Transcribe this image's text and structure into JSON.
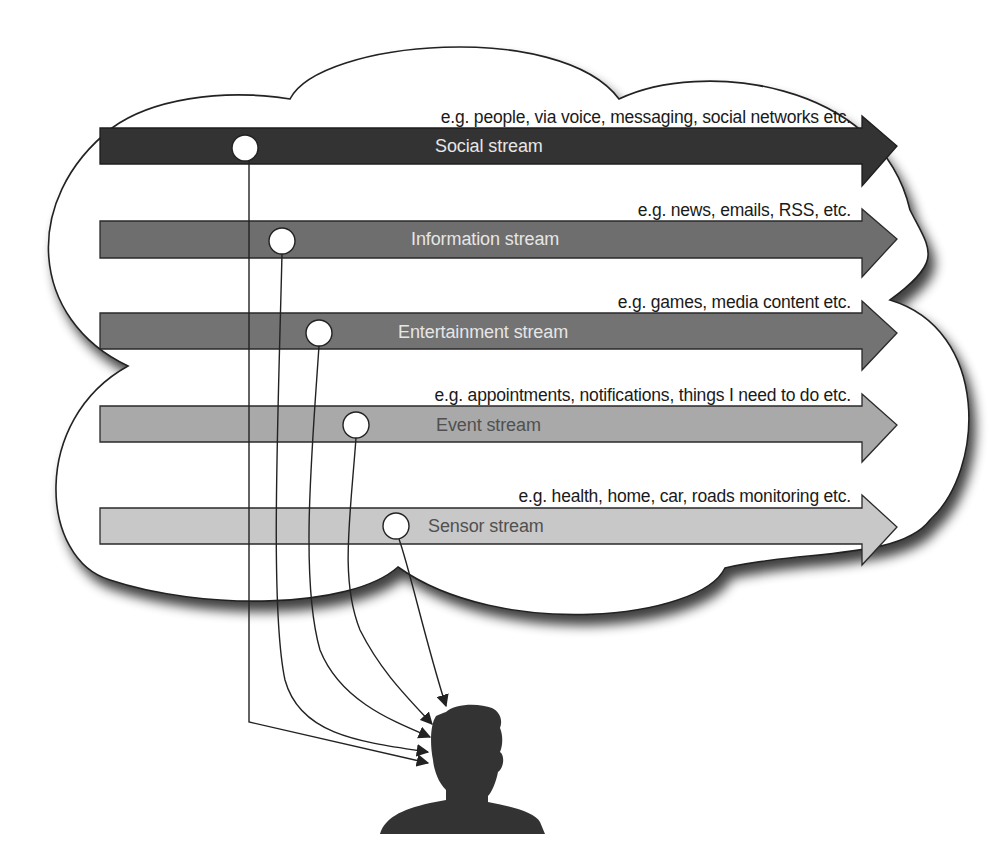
{
  "diagram": {
    "type": "information-streams-to-user",
    "streams": [
      {
        "name": "Social stream",
        "examples": "e.g. people, via voice, messaging, social networks etc.",
        "color": "#333333",
        "label_tone": "light"
      },
      {
        "name": "Information stream",
        "examples": "e.g. news, emails, RSS, etc.",
        "color": "#6e6e6e",
        "label_tone": "light"
      },
      {
        "name": "Entertainment stream",
        "examples": "e.g. games, media content etc.",
        "color": "#727272",
        "label_tone": "light"
      },
      {
        "name": "Event stream",
        "examples": "e.g. appointments, notifications,  things I need to do etc.",
        "color": "#a9a9a9",
        "label_tone": "dark"
      },
      {
        "name": "Sensor stream",
        "examples": "e.g. health, home, car, roads monitoring etc.",
        "color": "#c8c8c8",
        "label_tone": "dark"
      }
    ],
    "container": {
      "shape": "cloud",
      "fill": "#ffffff",
      "stroke": "#222222"
    },
    "recipient": {
      "shape": "person-silhouette",
      "color": "#333333"
    },
    "connectors": {
      "count": 5,
      "direction": "stream-to-person",
      "style": "thin-line-with-arrowhead"
    }
  }
}
